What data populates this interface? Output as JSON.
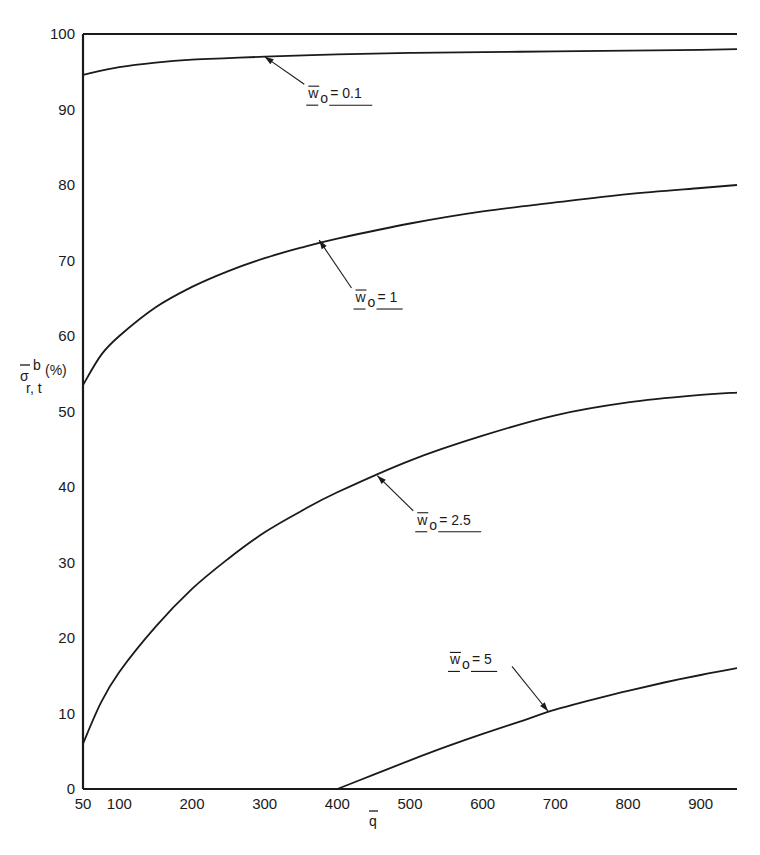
{
  "chart_data": {
    "type": "line",
    "title": "",
    "xlabel": "q̄",
    "ylabel": "σ̄ b r,t (%)",
    "ylabel_parts": {
      "main": "σ",
      "sup": "b",
      "sub": "r, t",
      "unit": "(%)"
    },
    "xlim": [
      50,
      950
    ],
    "ylim": [
      0,
      100
    ],
    "xticks": [
      50,
      100,
      200,
      300,
      400,
      500,
      600,
      700,
      800,
      900
    ],
    "yticks": [
      0,
      10,
      20,
      30,
      40,
      50,
      60,
      70,
      80,
      90,
      100
    ],
    "grid": false,
    "legend": "inline annotations with arrows",
    "series": [
      {
        "name": "w̄o = 0.1",
        "label_value": "0.1",
        "x": [
          50,
          100,
          150,
          200,
          250,
          300,
          400,
          500,
          600,
          700,
          800,
          900,
          950
        ],
        "y": [
          94.6,
          95.6,
          96.2,
          96.6,
          96.8,
          97.0,
          97.3,
          97.5,
          97.6,
          97.7,
          97.8,
          97.9,
          98.0
        ]
      },
      {
        "name": "w̄o = 1",
        "label_value": "1",
        "x": [
          50,
          75,
          100,
          150,
          200,
          250,
          300,
          350,
          400,
          500,
          600,
          700,
          800,
          900,
          950
        ],
        "y": [
          53.5,
          57.5,
          60.0,
          63.8,
          66.5,
          68.6,
          70.3,
          71.7,
          72.9,
          74.9,
          76.5,
          77.7,
          78.8,
          79.6,
          80.0
        ]
      },
      {
        "name": "w̄o = 2.5",
        "label_value": "2.5",
        "x": [
          50,
          75,
          100,
          150,
          200,
          250,
          300,
          350,
          400,
          500,
          600,
          700,
          800,
          900,
          950
        ],
        "y": [
          6.0,
          11.5,
          15.5,
          21.5,
          26.5,
          30.5,
          34.0,
          36.8,
          39.3,
          43.5,
          46.8,
          49.5,
          51.2,
          52.2,
          52.5
        ]
      },
      {
        "name": "w̄o = 5",
        "label_value": "5",
        "x": [
          400,
          450,
          500,
          550,
          600,
          650,
          700,
          750,
          800,
          850,
          900,
          950
        ],
        "y": [
          0.0,
          1.9,
          3.8,
          5.6,
          7.3,
          8.9,
          10.5,
          11.8,
          13.0,
          14.1,
          15.1,
          16.0
        ]
      }
    ],
    "annotations": [
      {
        "series": "w̄o = 0.1",
        "text_prefix": "w",
        "text_sub": "o",
        "text_value": "= 0.1",
        "arrow_to": [
          300,
          97.0
        ],
        "text_at": [
          360,
          91.5
        ]
      },
      {
        "series": "w̄o = 1",
        "text_prefix": "w",
        "text_sub": "o",
        "text_value": "= 1",
        "arrow_to": [
          375,
          72.7
        ],
        "text_at": [
          425,
          64.5
        ]
      },
      {
        "series": "w̄o = 2.5",
        "text_prefix": "w",
        "text_sub": "o",
        "text_value": "= 2.5",
        "arrow_to": [
          455,
          41.5
        ],
        "text_at": [
          510,
          35.0
        ]
      },
      {
        "series": "w̄o = 5",
        "text_prefix": "w",
        "text_sub": "o",
        "text_value": "= 5",
        "arrow_to": [
          690,
          10.3
        ],
        "text_at": [
          555,
          16.5
        ]
      }
    ],
    "line_color": "#1a1a1a",
    "background": "#ffffff"
  }
}
